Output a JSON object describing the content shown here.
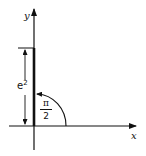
{
  "diagram": {
    "type": "complex-number-polar-plot",
    "axes": {
      "x_label": "x",
      "y_label": "y"
    },
    "vector": {
      "direction": "positive y-axis",
      "magnitude_label": "e",
      "magnitude_exponent": "2"
    },
    "angle": {
      "numerator": "π",
      "denominator": "2"
    },
    "colors": {
      "ink": "#111111",
      "background": "#ffffff"
    }
  }
}
